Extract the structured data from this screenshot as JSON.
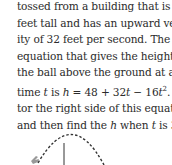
{
  "problem": {
    "lines": [
      [
        "tossed from a building that is 48"
      ],
      [
        "feet tall and has an upward veloc-"
      ],
      [
        "ity of 32 feet per second. The"
      ],
      [
        "equation that gives the height of"
      ],
      [
        "the ball above the ground at any"
      ],
      [
        "time ",
        {
          "i": "t"
        },
        " is ",
        {
          "i": "h"
        },
        " = 48 + 32",
        {
          "i": "t"
        },
        " − 16",
        {
          "i": "t"
        },
        {
          "sup": "2"
        },
        ". Fac-"
      ],
      [
        "tor the right side of this equation"
      ],
      [
        "and then find the ",
        {
          "i": "h"
        },
        " when ",
        {
          "i": "t"
        },
        " is 3."
      ]
    ]
  },
  "figure": {
    "curve_color": "#333333"
  }
}
